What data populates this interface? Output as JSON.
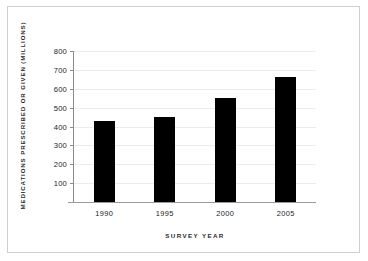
{
  "chart_data": {
    "type": "bar",
    "title": "",
    "xlabel": "SURVEY YEAR",
    "ylabel": "MEDICATIONS PRESCRIBED OR GIVEN (MILLIONS)",
    "categories": [
      "1990",
      "1995",
      "2000",
      "2005"
    ],
    "values": [
      430,
      450,
      550,
      660
    ],
    "series": [
      {
        "name": "Medications prescribed or given",
        "values": [
          430,
          450,
          550,
          660
        ]
      }
    ],
    "ylim": [
      0,
      800
    ],
    "yticks": [
      100,
      200,
      300,
      400,
      500,
      600,
      700,
      800
    ],
    "ytick_labels": [
      "100",
      "200",
      "300",
      "400",
      "500",
      "600",
      "700",
      "800"
    ],
    "xtick_labels": [
      "1990",
      "1995",
      "2000",
      "2005"
    ],
    "grid": true,
    "grid_axis": "y",
    "legend": false,
    "legend_position": "none",
    "bar_color": "#000000",
    "grid_color": "#ebebeb",
    "axis_color": "#8c8c8c",
    "background_color": "#ffffff",
    "frame_color": "#cfcfcf"
  }
}
